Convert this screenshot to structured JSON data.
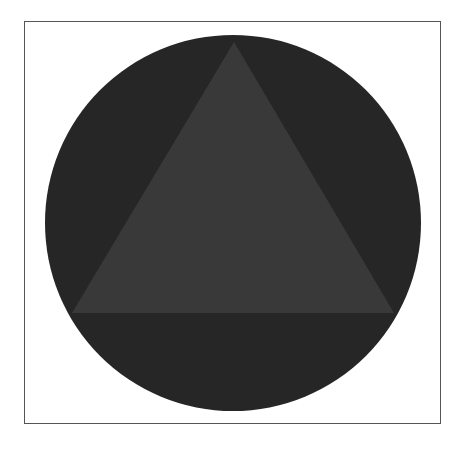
{
  "figure": {
    "frame": {
      "x": 24,
      "y": 21,
      "width": 417,
      "height": 403,
      "stroke": "#555555"
    },
    "circle": {
      "cx": 233,
      "cy": 223,
      "r": 188,
      "fill": "#262626"
    },
    "triangle": {
      "points": "234,42 72,313 394,313",
      "fill": "#393939"
    }
  }
}
